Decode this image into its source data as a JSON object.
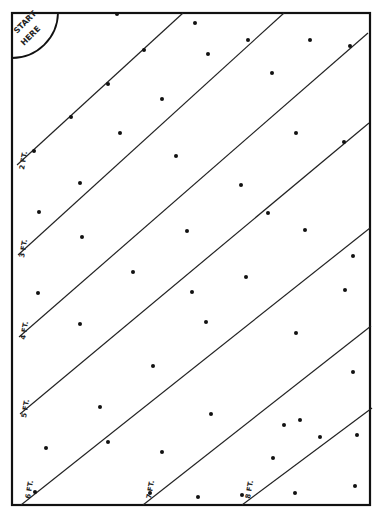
{
  "diagram": {
    "start_label_line1": "START",
    "start_label_line2": "HERE",
    "colors": {
      "ink": "#111111",
      "background": "#ffffff"
    },
    "frame": {
      "x1": 12,
      "y1": 13,
      "x2": 370,
      "y2": 505
    },
    "rows": [
      {
        "label": "2 FT.",
        "x1": 17,
        "y1": 165,
        "x2": 183,
        "y2": 13,
        "lx": 24,
        "ly": 170
      },
      {
        "label": "3 FT.",
        "x1": 18,
        "y1": 255,
        "x2": 284,
        "y2": 13,
        "lx": 24,
        "ly": 258
      },
      {
        "label": "4 FT.",
        "x1": 19,
        "y1": 337,
        "x2": 368,
        "y2": 33,
        "lx": 25,
        "ly": 340
      },
      {
        "label": "5 FT.",
        "x1": 20,
        "y1": 414,
        "x2": 369,
        "y2": 123,
        "lx": 26,
        "ly": 418
      },
      {
        "label": "6 FT.",
        "x1": 21,
        "y1": 505,
        "x2": 370,
        "y2": 228,
        "lx": 30,
        "ly": 499
      },
      {
        "label": "7 FT.",
        "x1": 143,
        "y1": 505,
        "x2": 371,
        "y2": 326,
        "lx": 151,
        "ly": 499
      },
      {
        "label": "8 FT.",
        "x1": 242,
        "y1": 505,
        "x2": 372,
        "y2": 408,
        "lx": 250,
        "ly": 499
      }
    ],
    "seeds": [
      [
        117,
        14
      ],
      [
        34,
        151
      ],
      [
        71,
        117
      ],
      [
        108,
        84
      ],
      [
        144,
        50
      ],
      [
        195,
        23
      ],
      [
        248,
        40
      ],
      [
        208,
        54
      ],
      [
        162,
        99
      ],
      [
        272,
        73
      ],
      [
        310,
        40
      ],
      [
        350,
        46
      ],
      [
        120,
        133
      ],
      [
        176,
        156
      ],
      [
        296,
        133
      ],
      [
        344,
        142
      ],
      [
        80,
        183
      ],
      [
        241,
        185
      ],
      [
        39,
        212
      ],
      [
        268,
        213
      ],
      [
        187,
        231
      ],
      [
        305,
        230
      ],
      [
        82,
        237
      ],
      [
        133,
        272
      ],
      [
        246,
        277
      ],
      [
        353,
        256
      ],
      [
        38,
        293
      ],
      [
        192,
        292
      ],
      [
        345,
        290
      ],
      [
        80,
        324
      ],
      [
        206,
        322
      ],
      [
        296,
        333
      ],
      [
        153,
        366
      ],
      [
        353,
        372
      ],
      [
        100,
        407
      ],
      [
        211,
        414
      ],
      [
        300,
        420
      ],
      [
        46,
        448
      ],
      [
        162,
        452
      ],
      [
        357,
        435
      ],
      [
        108,
        442
      ],
      [
        284,
        425
      ],
      [
        355,
        486
      ],
      [
        273,
        458
      ],
      [
        35,
        492
      ],
      [
        150,
        493
      ],
      [
        198,
        497
      ],
      [
        242,
        495
      ],
      [
        295,
        493
      ],
      [
        320,
        437
      ]
    ]
  }
}
